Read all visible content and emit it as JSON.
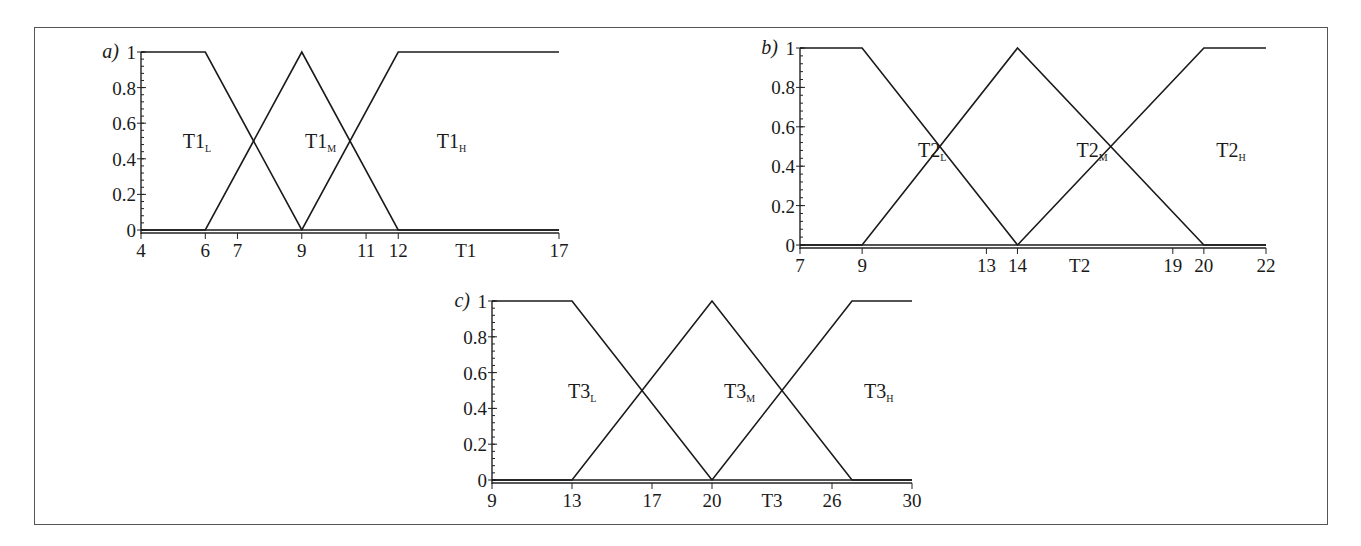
{
  "chart_data": [
    {
      "panel": "a)",
      "type": "line",
      "title": "",
      "xlabel": "T1",
      "ylabel": "",
      "xlim": [
        4,
        17
      ],
      "ylim": [
        0,
        1
      ],
      "x_ticks": [
        4,
        6,
        7,
        9,
        11,
        12,
        17
      ],
      "y_ticks": [
        0,
        0.2,
        0.4,
        0.6,
        0.8,
        1
      ],
      "y_tick_labels": [
        "0",
        "0.2",
        "0.4",
        "0.6",
        "0.8",
        "1"
      ],
      "grid": false,
      "series": [
        {
          "name": "T1_L",
          "label": "T1",
          "subscript": "L",
          "x": [
            4,
            6,
            12,
            17
          ],
          "y": [
            1,
            1,
            0,
            0
          ],
          "points": [
            [
              4,
              1
            ],
            [
              6,
              1
            ],
            [
              9,
              0
            ],
            [
              12,
              0
            ],
            [
              17,
              0
            ]
          ]
        },
        {
          "name": "T1_M",
          "label": "T1",
          "subscript": "M",
          "points": [
            [
              4,
              0
            ],
            [
              6,
              0
            ],
            [
              9,
              1
            ],
            [
              12,
              0
            ],
            [
              17,
              0
            ]
          ]
        },
        {
          "name": "T1_H",
          "label": "T1",
          "subscript": "H",
          "points": [
            [
              4,
              0
            ],
            [
              9,
              0
            ],
            [
              12,
              1
            ],
            [
              17,
              1
            ]
          ]
        }
      ],
      "label_positions": [
        [
          5.3,
          0.5
        ],
        [
          9.1,
          0.5
        ],
        [
          13.2,
          0.5
        ]
      ]
    },
    {
      "panel": "b)",
      "type": "line",
      "title": "",
      "xlabel": "T2",
      "ylabel": "",
      "xlim": [
        7,
        22
      ],
      "ylim": [
        0,
        1
      ],
      "x_ticks": [
        7,
        9,
        13,
        14,
        19,
        20,
        22
      ],
      "y_ticks": [
        0,
        0.2,
        0.4,
        0.6,
        0.8,
        1
      ],
      "y_tick_labels": [
        "0",
        "0.2",
        "0.4",
        "0.6",
        "0.8",
        "1"
      ],
      "grid": false,
      "series": [
        {
          "name": "T2_L",
          "label": "T2",
          "subscript": "L",
          "points": [
            [
              7,
              1
            ],
            [
              9,
              1
            ],
            [
              14,
              0
            ],
            [
              22,
              0
            ]
          ]
        },
        {
          "name": "T2_M",
          "label": "T2",
          "subscript": "M",
          "points": [
            [
              7,
              0
            ],
            [
              9,
              0
            ],
            [
              14,
              1
            ],
            [
              20,
              0
            ],
            [
              22,
              0
            ]
          ]
        },
        {
          "name": "T2_H",
          "label": "T2",
          "subscript": "H",
          "points": [
            [
              7,
              0
            ],
            [
              14,
              0
            ],
            [
              20,
              1
            ],
            [
              22,
              1
            ]
          ]
        }
      ],
      "label_positions": [
        [
          10.8,
          0.48
        ],
        [
          15.9,
          0.48
        ],
        [
          20.4,
          0.48
        ]
      ]
    },
    {
      "panel": "c)",
      "type": "line",
      "title": "",
      "xlabel": "T3",
      "ylabel": "",
      "xlim": [
        9,
        30
      ],
      "ylim": [
        0,
        1
      ],
      "x_ticks": [
        9,
        13,
        17,
        20,
        26,
        30
      ],
      "y_ticks": [
        0,
        0.2,
        0.4,
        0.6,
        0.8,
        1
      ],
      "y_tick_labels": [
        "0",
        "0.2",
        "0.4",
        "0.6",
        "0.8",
        "1"
      ],
      "grid": false,
      "series": [
        {
          "name": "T3_L",
          "label": "T3",
          "subscript": "L",
          "points": [
            [
              9,
              1
            ],
            [
              13,
              1
            ],
            [
              20,
              0
            ],
            [
              30,
              0
            ]
          ]
        },
        {
          "name": "T3_M",
          "label": "T3",
          "subscript": "M",
          "points": [
            [
              9,
              0
            ],
            [
              13,
              0
            ],
            [
              20,
              1
            ],
            [
              27,
              0
            ],
            [
              30,
              0
            ]
          ]
        },
        {
          "name": "T3_H",
          "label": "T3",
          "subscript": "H",
          "points": [
            [
              9,
              0
            ],
            [
              20,
              0
            ],
            [
              27,
              1
            ],
            [
              30,
              1
            ]
          ]
        }
      ],
      "label_positions": [
        [
          12.8,
          0.5
        ],
        [
          20.6,
          0.5
        ],
        [
          27.6,
          0.5
        ]
      ]
    }
  ],
  "layout": {
    "panels": [
      {
        "id": "a",
        "x0px": 141,
        "x1px": 559,
        "y0px": 230,
        "y1px": 52
      },
      {
        "id": "b",
        "x0px": 800,
        "x1px": 1266,
        "y0px": 245,
        "y1px": 48
      },
      {
        "id": "c",
        "x0px": 492,
        "x1px": 912,
        "y0px": 480,
        "y1px": 301
      }
    ]
  }
}
